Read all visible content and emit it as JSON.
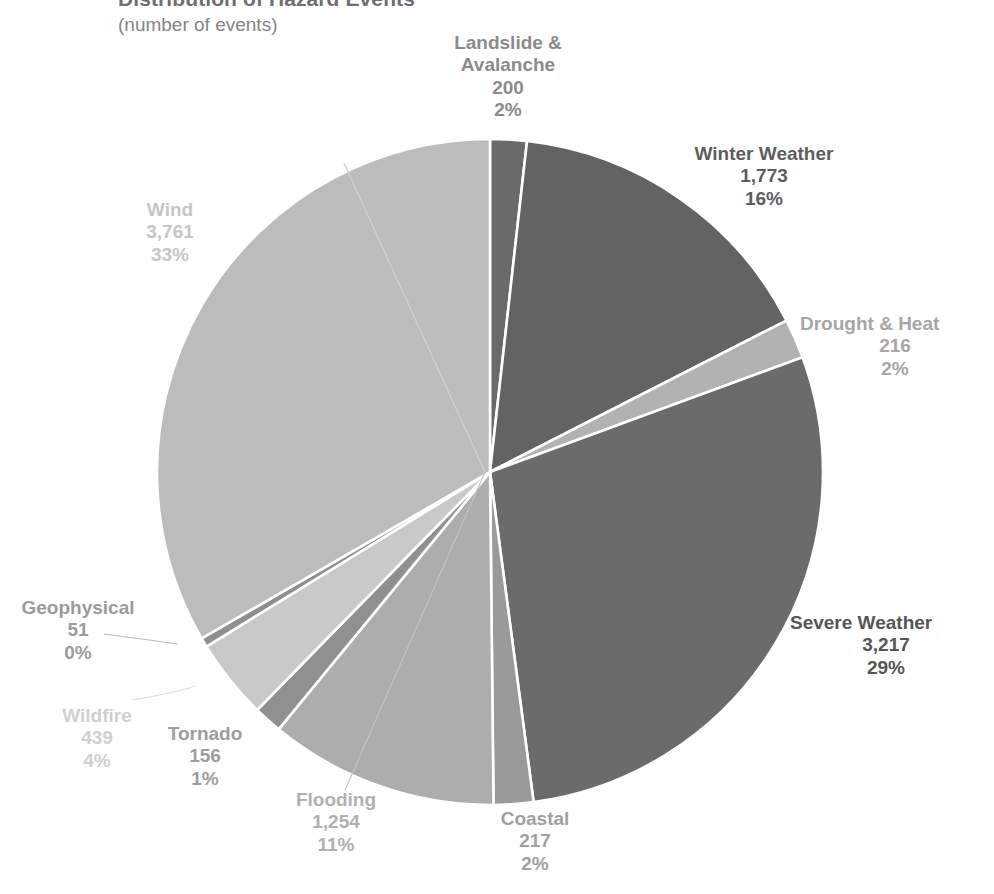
{
  "chart_data": {
    "type": "pie",
    "title": "Distribution of Hazard Events",
    "subtitle": "(number of events)",
    "xlabel": "",
    "ylabel": "",
    "legend": "none",
    "grid": false,
    "total": 11284,
    "categories": [
      "Landslide & Avalanche",
      "Winter Weather",
      "Drought & Heat",
      "Severe Weather",
      "Coastal",
      "Flooding",
      "Tornado",
      "Wildfire",
      "Geophysical",
      "Wind"
    ],
    "values": [
      200,
      1773,
      216,
      3217,
      217,
      1254,
      156,
      439,
      51,
      3761
    ],
    "percents": [
      "2%",
      "16%",
      "2%",
      "29%",
      "2%",
      "11%",
      "1%",
      "4%",
      "0%",
      "33%"
    ],
    "colors": [
      "#6a6a6a",
      "#636363",
      "#b2b2b2",
      "#6b6b6b",
      "#9a9a9a",
      "#adadad",
      "#909090",
      "#c9c9c9",
      "#8f8f8f",
      "#bcbcbc"
    ],
    "slices": [
      {
        "name": "Landslide & Avalanche",
        "name_line1": "Landslide &",
        "name_line2": "Avalanche",
        "value": "200",
        "percent": "2%",
        "color": "#6a6a6a",
        "label_color": "#8b8b8b"
      },
      {
        "name": "Winter Weather",
        "name_line1": "Winter Weather",
        "name_line2": "",
        "value": "1,773",
        "percent": "16%",
        "color": "#636363",
        "label_color": "#5d5d5d"
      },
      {
        "name": "Drought & Heat",
        "name_line1": "Drought & Heat",
        "name_line2": "",
        "value": "216",
        "percent": "2%",
        "color": "#b2b2b2",
        "label_color": "#a6a6a6"
      },
      {
        "name": "Severe Weather",
        "name_line1": "Severe Weather",
        "name_line2": "",
        "value": "3,217",
        "percent": "29%",
        "color": "#6b6b6b",
        "label_color": "#565656"
      },
      {
        "name": "Coastal",
        "name_line1": "Coastal",
        "name_line2": "",
        "value": "217",
        "percent": "2%",
        "color": "#9a9a9a",
        "label_color": "#a0a0a0"
      },
      {
        "name": "Flooding",
        "name_line1": "Flooding",
        "name_line2": "",
        "value": "1,254",
        "percent": "11%",
        "color": "#adadad",
        "label_color": "#b0b0b0"
      },
      {
        "name": "Tornado",
        "name_line1": "Tornado",
        "name_line2": "",
        "value": "156",
        "percent": "1%",
        "color": "#909090",
        "label_color": "#9d9d9d"
      },
      {
        "name": "Wildfire",
        "name_line1": "Wildfire",
        "name_line2": "",
        "value": "439",
        "percent": "4%",
        "color": "#c9c9c9",
        "label_color": "#cfcfcf"
      },
      {
        "name": "Geophysical",
        "name_line1": "Geophysical",
        "name_line2": "",
        "value": "51",
        "percent": "0%",
        "color": "#8f8f8f",
        "label_color": "#9b9b9b"
      },
      {
        "name": "Wind",
        "name_line1": "Wind",
        "name_line2": "",
        "value": "3,761",
        "percent": "33%",
        "color": "#bcbcbc",
        "label_color": "#c6c6c6"
      }
    ]
  },
  "geometry": {
    "center_x": 490,
    "center_y": 472,
    "radius": 333,
    "slice_border_color": "#ffffff",
    "leader_line_color": "#b9b9b9",
    "background": "#ffffff"
  }
}
